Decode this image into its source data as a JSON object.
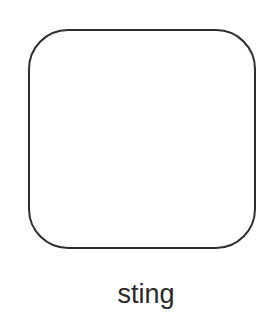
{
  "shape": {
    "type": "rounded-square",
    "stroke_color": "#2e2e2e",
    "fill_color": "#ffffff"
  },
  "label": {
    "text": "sting"
  }
}
